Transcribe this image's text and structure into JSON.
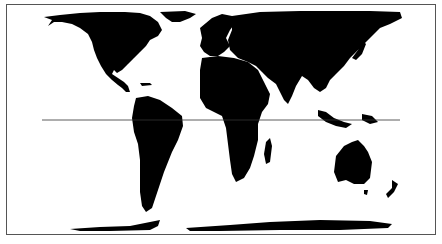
{
  "map": {
    "title": "",
    "projection": "equal-area world map (Peters-style)",
    "colors": {
      "land": "#000000",
      "ocean": "#ffffff",
      "border": "#555555",
      "equator": "#333333"
    },
    "features": [
      {
        "name": "North America"
      },
      {
        "name": "Greenland"
      },
      {
        "name": "South America"
      },
      {
        "name": "Europe"
      },
      {
        "name": "Africa"
      },
      {
        "name": "Madagascar"
      },
      {
        "name": "Asia"
      },
      {
        "name": "Indonesia"
      },
      {
        "name": "Australia"
      },
      {
        "name": "New Zealand"
      },
      {
        "name": "Antarctica"
      },
      {
        "name": "Equator line"
      }
    ]
  }
}
